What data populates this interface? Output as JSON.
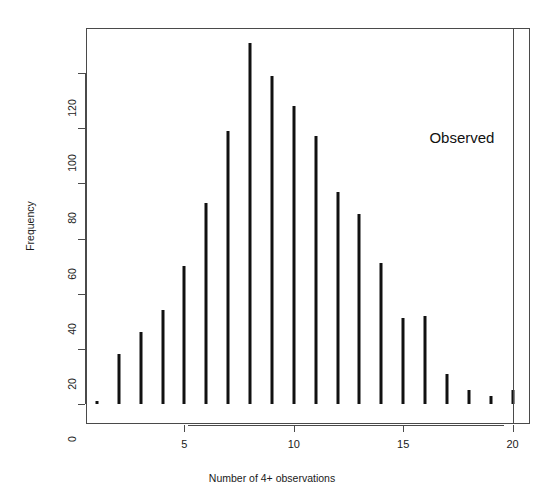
{
  "chart_data": {
    "type": "bar",
    "title": "",
    "xlabel": "Number of 4+ observations",
    "ylabel": "Frequency",
    "xlim": [
      0.5,
      20.8
    ],
    "ylim": [
      0,
      137
    ],
    "grid": false,
    "legend": null,
    "xticks": [
      5,
      10,
      15,
      20
    ],
    "yticks": [
      0,
      20,
      40,
      60,
      80,
      100,
      120
    ],
    "ytick_labels": [
      "0",
      "20",
      "40",
      "60",
      "80",
      "100",
      "120"
    ],
    "xtick_labels": [
      "5",
      "10",
      "15",
      "20"
    ],
    "categories": [
      1,
      2,
      3,
      4,
      5,
      6,
      7,
      8,
      9,
      10,
      11,
      12,
      13,
      14,
      15,
      16,
      17,
      18,
      19,
      20
    ],
    "values": [
      1,
      18,
      26,
      34,
      50,
      73,
      99,
      131,
      119,
      108,
      97,
      77,
      69,
      51,
      31,
      32,
      11,
      5,
      3,
      5
    ],
    "annotations": [
      {
        "name": "observed-reference-line",
        "type": "vline",
        "x": 20,
        "label": "Observed",
        "label_x": 16.2,
        "label_y": 96
      }
    ]
  },
  "axes": {
    "x_label": "Number of 4+ observations",
    "y_label": "Frequency"
  }
}
